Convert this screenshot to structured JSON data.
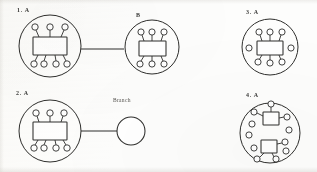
{
  "figure": {
    "background_color": "#fdfdfc",
    "ink_color": "#2e2e2c",
    "width": 317,
    "height": 172
  },
  "panels": [
    {
      "id": "panel-1",
      "label": "1. A",
      "label_x": 17,
      "label_y": 8,
      "boundary": {
        "cx": 50,
        "cy": 46,
        "r": 31
      },
      "box": {
        "x": 33,
        "y": 37,
        "w": 34,
        "h": 18
      },
      "top_terminals": 3,
      "bottom_terminals": 4,
      "free_terminals": 0,
      "connector": {
        "from_x": 81,
        "from_y": 49,
        "to_x": 122,
        "to_y": 49
      }
    },
    {
      "id": "panel-b",
      "label": "B",
      "label_x": 136,
      "label_y": 13,
      "boundary": {
        "cx": 152,
        "cy": 47,
        "r": 27
      },
      "box": {
        "x": 139,
        "y": 41,
        "w": 27,
        "h": 15
      },
      "top_terminals": 3,
      "bottom_terminals": 3,
      "free_terminals": 0,
      "connector": null
    },
    {
      "id": "panel-3",
      "label": "3. A",
      "label_x": 246,
      "label_y": 10,
      "boundary": {
        "cx": 270,
        "cy": 47,
        "r": 28
      },
      "box": {
        "x": 257,
        "y": 41,
        "w": 26,
        "h": 14
      },
      "top_terminals": 3,
      "bottom_terminals": 3,
      "free_terminals": 2,
      "connector": null
    },
    {
      "id": "panel-2",
      "label": "2. A",
      "label_x": 16,
      "label_y": 91,
      "boundary": {
        "cx": 50,
        "cy": 131,
        "r": 31
      },
      "box": {
        "x": 33,
        "y": 122,
        "w": 34,
        "h": 18
      },
      "top_terminals": 3,
      "bottom_terminals": 4,
      "free_terminals": 0,
      "connector": {
        "from_x": 81,
        "from_y": 131,
        "to_x": 116,
        "to_y": 131
      }
    },
    {
      "id": "panel-4",
      "label": "4. A",
      "label_x": 246,
      "label_y": 93,
      "boundary": {
        "cx": 270,
        "cy": 133,
        "r": 30
      },
      "box": null,
      "top_terminals": 0,
      "bottom_terminals": 0,
      "free_terminals": 8,
      "connector": null
    }
  ],
  "branch": {
    "label": "Branch",
    "label_x": 113,
    "label_y": 97,
    "circle": {
      "cx": 131,
      "cy": 131,
      "r": 14
    }
  },
  "panel4_nodes": {
    "upper_box": {
      "x": 263,
      "y": 112,
      "w": 16,
      "h": 13
    },
    "lower_box": {
      "x": 261,
      "y": 140,
      "w": 16,
      "h": 13
    },
    "upper_stems": 3,
    "lower_stems": 3,
    "scatter_circles": 5
  },
  "geometry": {
    "terminal_radius": 3.2,
    "stem_length": 8,
    "stroke_width": 0.9
  }
}
